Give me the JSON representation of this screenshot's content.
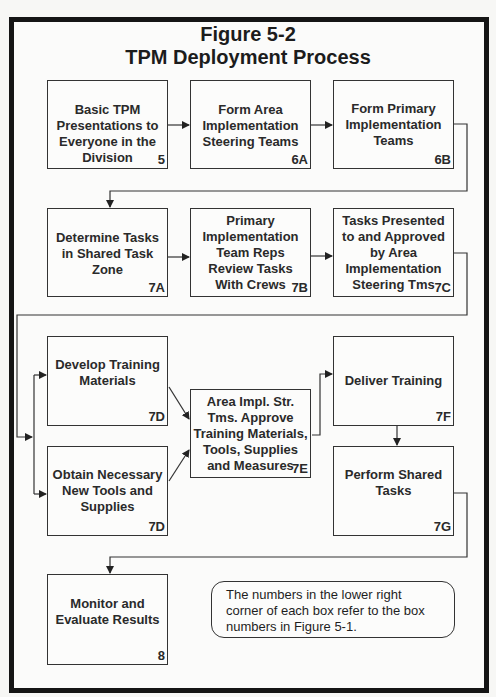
{
  "figure": {
    "title_line1": "Figure 5-2",
    "title_line2": "TPM Deployment Process"
  },
  "boxes": [
    {
      "id": "5",
      "lines": [
        "Basic TPM",
        "Presentations to",
        "Everyone in the",
        "Division"
      ],
      "number": "5"
    },
    {
      "id": "6A",
      "lines": [
        "Form Area",
        "Implementation",
        "Steering Teams"
      ],
      "number": "6A"
    },
    {
      "id": "6B",
      "lines": [
        "Form Primary",
        "Implementation",
        "Teams"
      ],
      "number": "6B"
    },
    {
      "id": "7A",
      "lines": [
        "Determine Tasks",
        "in Shared Task",
        "Zone"
      ],
      "number": "7A"
    },
    {
      "id": "7B",
      "lines": [
        "Primary",
        "Implementation",
        "Team Reps",
        "Review Tasks",
        "With Crews"
      ],
      "number": "7B"
    },
    {
      "id": "7C",
      "lines": [
        "Tasks Presented",
        "to and Approved",
        "by Area",
        "Implementation",
        "Steering Tms"
      ],
      "number": "7C"
    },
    {
      "id": "7D-1",
      "lines": [
        "Develop Training",
        "Materials"
      ],
      "number": "7D"
    },
    {
      "id": "7D-2",
      "lines": [
        "Obtain Necessary",
        "New Tools and",
        "Supplies"
      ],
      "number": "7D"
    },
    {
      "id": "7E",
      "lines": [
        "Area Impl. Str.",
        "Tms. Approve",
        "Training Materials,",
        "Tools, Supplies",
        "and Measures"
      ],
      "number": "7E"
    },
    {
      "id": "7F",
      "lines": [
        "Deliver Training"
      ],
      "number": "7F"
    },
    {
      "id": "7G",
      "lines": [
        "Perform Shared",
        "Tasks"
      ],
      "number": "7G"
    },
    {
      "id": "8",
      "lines": [
        "Monitor and",
        "Evaluate Results"
      ],
      "number": "8"
    }
  ],
  "note": {
    "lines": [
      "The numbers in the lower right",
      "corner of each box refer to the box",
      "numbers in Figure 5-1."
    ]
  },
  "flow": [
    [
      "5",
      "6A"
    ],
    [
      "6A",
      "6B"
    ],
    [
      "6B",
      "7A"
    ],
    [
      "7A",
      "7B"
    ],
    [
      "7B",
      "7C"
    ],
    [
      "7C",
      "7D-1"
    ],
    [
      "7C",
      "7D-2"
    ],
    [
      "7D-1",
      "7E"
    ],
    [
      "7D-2",
      "7E"
    ],
    [
      "7E",
      "7F"
    ],
    [
      "7F",
      "7G"
    ],
    [
      "7G",
      "8"
    ]
  ],
  "colors": {
    "frame": "#151515",
    "line": "#333333",
    "background": "#fbfbfa"
  }
}
